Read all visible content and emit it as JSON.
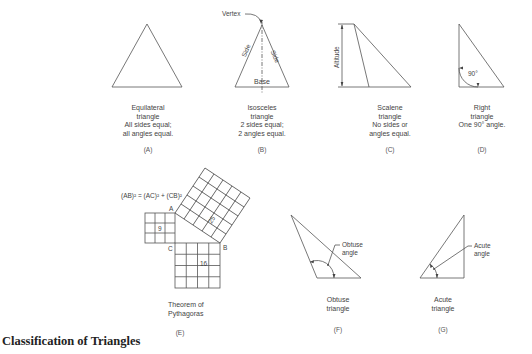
{
  "title": "Classification of Triangles",
  "figures": {
    "A": {
      "letter": "(A)",
      "caption": [
        "Equilateral",
        "triangle",
        "All sides equal;",
        "all angles equal."
      ]
    },
    "B": {
      "letter": "(B)",
      "caption": [
        "Isosceles",
        "triangle",
        "2 sides equal;",
        "2 angles equal."
      ],
      "labels": {
        "vertex": "Vertex",
        "side_left": "Side",
        "side_right": "Side",
        "base": "Base"
      }
    },
    "C": {
      "letter": "(C)",
      "caption": [
        "Scalene",
        "triangle",
        "No sides or",
        "angles equal."
      ],
      "labels": {
        "altitude": "Altitude"
      }
    },
    "D": {
      "letter": "(D)",
      "caption": [
        "Right",
        "triangle",
        "One 90° angle."
      ],
      "labels": {
        "angle": "90°"
      }
    },
    "E": {
      "letter": "(E)",
      "caption": [
        "Theorem of",
        "Pythagoras"
      ],
      "formula": "(AB)² = (AC)² + (CB)²",
      "labels": {
        "A": "A",
        "B": "B",
        "C": "C",
        "square_small": "9",
        "square_medium": "16",
        "square_large": "25"
      }
    },
    "F": {
      "letter": "(F)",
      "caption": [
        "Obtuse",
        "triangle"
      ],
      "labels": {
        "angle_line1": "Obtuse",
        "angle_line2": "angle"
      }
    },
    "G": {
      "letter": "(G)",
      "caption": [
        "Acute",
        "triangle"
      ],
      "labels": {
        "angle_line1": "Acute",
        "angle_line2": "angle"
      }
    }
  }
}
